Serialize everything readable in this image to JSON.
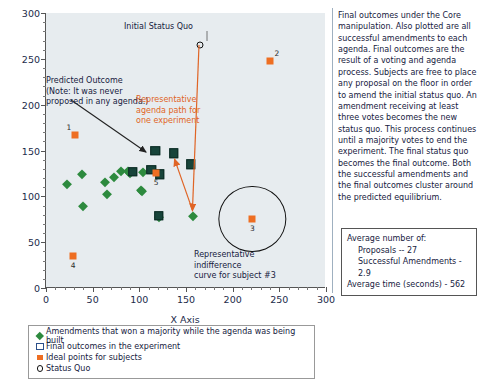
{
  "chart_data": {
    "type": "scatter",
    "title": "",
    "xlabel": "X Axis",
    "ylabel": "",
    "xlim": [
      0,
      300
    ],
    "ylim": [
      0,
      300
    ],
    "xticks": [
      0,
      50,
      100,
      150,
      200,
      250,
      300
    ],
    "yticks": [
      0,
      50,
      100,
      150,
      200,
      250,
      300
    ],
    "xtick_labels": [
      "0",
      "50",
      "100",
      "150",
      "200",
      "250",
      "300"
    ],
    "ytick_labels": [
      "0",
      "50",
      "100",
      "150",
      "200",
      "250",
      "300"
    ],
    "grid": false,
    "legend_position": "below-axes",
    "plot_background": "#e7ecef",
    "series": [
      {
        "name": "Amendments that won a majority while the agenda was being built",
        "marker": "diamond",
        "color": "#2d8a3e",
        "points": [
          [
            22,
            113
          ],
          [
            39,
            124
          ],
          [
            40,
            89
          ],
          [
            63,
            116
          ],
          [
            65,
            103
          ],
          [
            73,
            121
          ],
          [
            80,
            128
          ],
          [
            88,
            128
          ],
          [
            102,
            107
          ],
          [
            103,
            106
          ],
          [
            104,
            127
          ],
          [
            121,
            77
          ],
          [
            158,
            79
          ],
          [
            90,
            126
          ]
        ]
      },
      {
        "name": "Final outcomes in the experiment",
        "marker": "square",
        "color": "#17443a",
        "points": [
          [
            93,
            127
          ],
          [
            113,
            129
          ],
          [
            117,
            150
          ],
          [
            122,
            124
          ],
          [
            137,
            147
          ],
          [
            155,
            135
          ],
          [
            121,
            79
          ]
        ]
      },
      {
        "name": "Ideal points for subjects",
        "marker": "square-orange",
        "color": "#ee6e22",
        "points": [
          [
            31,
            167
          ],
          [
            240,
            248
          ],
          [
            221,
            75
          ],
          [
            29,
            35
          ],
          [
            118,
            126
          ]
        ],
        "labels": [
          "1",
          "2",
          "3",
          "4",
          "5"
        ]
      },
      {
        "name": "Status Quo",
        "marker": "circle-open",
        "color": "#111111",
        "points": [
          [
            165,
            265
          ]
        ]
      }
    ],
    "agenda_path": {
      "name": "Representative agenda path for one experiment",
      "color": "#e06425",
      "points": [
        [
          165,
          265
        ],
        [
          158,
          85
        ],
        [
          139,
          140
        ]
      ]
    },
    "indifference_curve": {
      "label": "Representative indifference curve for subject #3",
      "center": [
        221,
        75
      ],
      "radius_x": 35,
      "radius_y": 35
    },
    "annotations": {
      "status_quo": "Initial Status Quo",
      "predicted_outcome": "Predicted Outcome\n(Note: It was never\nproposed in any agenda.)",
      "agenda_path": "Representative\nagenda path for\none experiment",
      "indifference": "Representative indifference\ncurve for subject #3"
    }
  },
  "legend": {
    "items": [
      {
        "marker": "diamond-green",
        "label": "Amendments that won a majority while the agenda was being built"
      },
      {
        "marker": "square-open",
        "label": "Final outcomes in the experiment"
      },
      {
        "marker": "square-orange",
        "label": "Ideal points for subjects"
      },
      {
        "marker": "circle-open",
        "label": "Status Quo"
      }
    ]
  },
  "stats": {
    "heading": "Average number of:",
    "proposals": "Proposals -- 27",
    "successful_amendments": "Successful Amendments - 2.9",
    "average_time": "Average time (seconds) - 562"
  },
  "colors": {
    "green": "#2d8a3e",
    "dark_green": "#17443a",
    "orange": "#ee6e22",
    "path_orange": "#e06425",
    "plot_bg": "#e7ecef"
  }
}
